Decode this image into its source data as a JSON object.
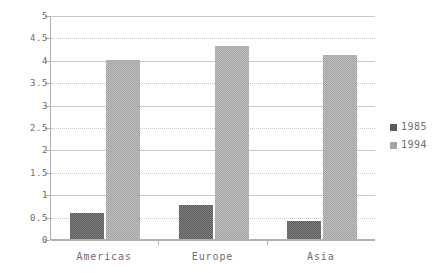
{
  "chart_data": {
    "type": "bar",
    "title": "",
    "xlabel": "",
    "ylabel": "",
    "categories": [
      "Americas",
      "Europe",
      "Asia"
    ],
    "series": [
      {
        "name": "1985",
        "values": [
          0.57,
          0.75,
          0.4
        ],
        "color": "#5c5c5c"
      },
      {
        "name": "1994",
        "values": [
          4.0,
          4.3,
          4.1
        ],
        "color": "#a3a3a3"
      }
    ],
    "ylim": [
      0,
      5
    ],
    "ytick_values": [
      0,
      0.5,
      1,
      1.5,
      2,
      2.5,
      3,
      3.5,
      4,
      4.5,
      5
    ],
    "ytick_labels": [
      "0",
      "0.5",
      "1",
      "1.5",
      "2",
      "2.5",
      "3",
      "3.5",
      "4",
      "4.5",
      "5"
    ],
    "grid": true,
    "legend_position": "right",
    "legend_entries": [
      "1985",
      "1994"
    ]
  }
}
